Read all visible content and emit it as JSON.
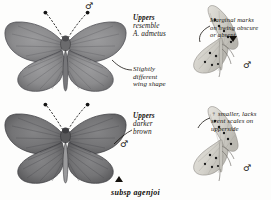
{
  "plate": {
    "caption": "subsp agenjoi"
  },
  "annotations": [
    {
      "id": "uppers-resemble",
      "lead": "Uppers",
      "body": "resemble\nA. admetus"
    },
    {
      "id": "wing-shape",
      "lead": "",
      "body": "Slightly\ndifferent\nwing shape"
    },
    {
      "id": "uppers-darker",
      "lead": "Uppers",
      "body": "darker\nbrown"
    },
    {
      "id": "marginal-marks",
      "lead": "",
      "body": "Marginal marks\non hwing obscure\nor absent"
    },
    {
      "id": "female-note",
      "lead": "",
      "body": "♀ smaller, lacks\nscent scales on\nupperside"
    }
  ],
  "symbols": {
    "male": "♂",
    "female": "♀"
  },
  "specimens": [
    {
      "id": "upper-left",
      "view": "upperside",
      "sex": "♂",
      "wing_color": "#8a8a8c",
      "body_color": "#6f6f70"
    },
    {
      "id": "lower-left",
      "view": "upperside",
      "sex": "♂",
      "wing_color": "#737375",
      "body_color": "#5c5c5e"
    },
    {
      "id": "upper-right",
      "view": "underside",
      "sex": "♂",
      "wing_color": "#cfcdc6",
      "spot_color": "#1a1a1a"
    },
    {
      "id": "lower-right",
      "view": "underside",
      "sex": "♂",
      "wing_color": "#d4d2cb",
      "spot_color": "#1a1a1a"
    }
  ]
}
